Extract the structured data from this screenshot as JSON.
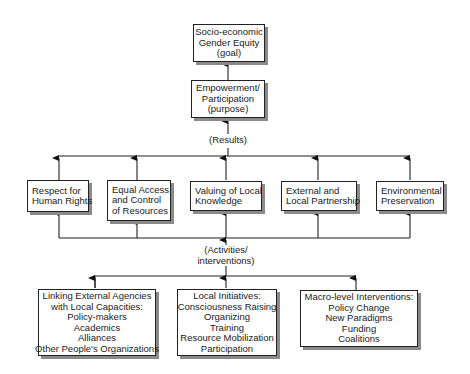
{
  "diagram": {
    "goal": {
      "lines": [
        "Socio-economic",
        "Gender Equity",
        "(goal)"
      ]
    },
    "purpose": {
      "lines": [
        "Empowerment/",
        "Participation",
        "(purpose)"
      ]
    },
    "results_label": "(Results)",
    "activities_label": {
      "lines": [
        "(Activities/",
        "interventions)"
      ]
    },
    "results": [
      {
        "id": "human-rights",
        "lines": [
          "Respect for",
          "Human Rights"
        ]
      },
      {
        "id": "equal-access",
        "lines": [
          "Equal Access",
          "and Control",
          "of Resources"
        ]
      },
      {
        "id": "local-knowledge",
        "lines": [
          "Valuing of Local",
          "Knowledge"
        ]
      },
      {
        "id": "partnership",
        "lines": [
          "External and",
          "Local Partnership"
        ]
      },
      {
        "id": "environment",
        "lines": [
          "Environmental",
          "Preservation"
        ]
      }
    ],
    "activities": [
      {
        "id": "linking",
        "lines": [
          "Linking External Agencies",
          "with Local Capacities:",
          "Policy-makers",
          "Academics",
          "Alliances",
          "Other People's Organizations"
        ]
      },
      {
        "id": "local-initiatives",
        "lines": [
          "Local Initiatives:",
          "Consciousness Raising",
          "Organizing",
          "Training",
          "Resource Mobilization",
          "Participation"
        ]
      },
      {
        "id": "macro",
        "lines": [
          "Macro-level Interventions:",
          "Policy Change",
          "New Paradigms",
          "Funding",
          "Coalitions"
        ]
      }
    ]
  }
}
